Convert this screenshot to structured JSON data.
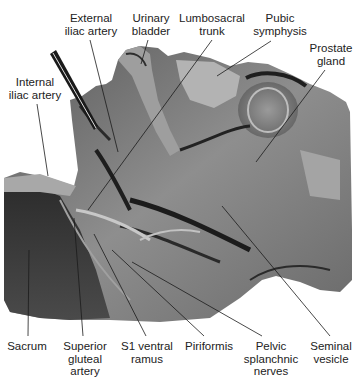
{
  "figure": {
    "type": "anatomical-photograph",
    "colors": {
      "background": "#ffffff",
      "label_text": "#222222",
      "leader_line": "#1a1a1a",
      "tissue_dark": "#2a2a2a",
      "tissue_mid": "#6e6e6e",
      "tissue_light": "#b5b5b5"
    },
    "labels": [
      {
        "id": "external-iliac-artery",
        "text": "External\niliac artery",
        "x": 66,
        "y": 12,
        "w": 50,
        "pointer": {
          "x1": 90,
          "y1": 40,
          "x2": 118,
          "y2": 152
        }
      },
      {
        "id": "urinary-bladder",
        "text": "Urinary\nbladder",
        "x": 128,
        "y": 12,
        "w": 46,
        "pointer": {
          "x1": 148,
          "y1": 40,
          "x2": 141,
          "y2": 64
        }
      },
      {
        "id": "lumbosacral-trunk",
        "text": "Lumbosacral\ntrunk",
        "x": 178,
        "y": 12,
        "w": 68,
        "pointer": {
          "x1": 212,
          "y1": 40,
          "x2": 88,
          "y2": 210
        }
      },
      {
        "id": "pubic-symphysis",
        "text": "Pubic\nsymphysis",
        "x": 250,
        "y": 12,
        "w": 60,
        "pointer": {
          "x1": 271,
          "y1": 41,
          "x2": 217,
          "y2": 76
        }
      },
      {
        "id": "prostate-gland",
        "text": "Prostate\ngland",
        "x": 307,
        "y": 42,
        "w": 50,
        "pointer": {
          "x1": 325,
          "y1": 70,
          "x2": 256,
          "y2": 162
        }
      },
      {
        "id": "internal-iliac-artery",
        "text": "Internal\niliac artery",
        "x": 4,
        "y": 76,
        "w": 58,
        "pointer": {
          "x1": 37,
          "y1": 104,
          "x2": 48,
          "y2": 176
        }
      },
      {
        "id": "sacrum",
        "text": "Sacrum",
        "x": 4,
        "y": 339,
        "w": 46,
        "pointer": {
          "x1": 28,
          "y1": 336,
          "x2": 29,
          "y2": 250
        }
      },
      {
        "id": "superior-gluteal-artery",
        "text": "Superior\ngluteal\nartery",
        "x": 62,
        "y": 339,
        "w": 48,
        "pointer": {
          "x1": 83,
          "y1": 336,
          "x2": 74,
          "y2": 218
        }
      },
      {
        "id": "s1-ventral-ramus",
        "text": "S1 ventral\nramus",
        "x": 118,
        "y": 339,
        "w": 58,
        "pointer": {
          "x1": 146,
          "y1": 336,
          "x2": 94,
          "y2": 234
        }
      },
      {
        "id": "piriformis",
        "text": "Piriformis",
        "x": 180,
        "y": 339,
        "w": 58,
        "pointer": {
          "x1": 204,
          "y1": 336,
          "x2": 112,
          "y2": 250
        }
      },
      {
        "id": "pelvic-splanchnic-nerves",
        "text": "Pelvic\nsplanchnic\nnerves",
        "x": 240,
        "y": 339,
        "w": 62,
        "pointer": {
          "x1": 262,
          "y1": 336,
          "x2": 132,
          "y2": 262
        }
      },
      {
        "id": "seminal-vesicle",
        "text": "Seminal\nvesicle",
        "x": 305,
        "y": 339,
        "w": 50,
        "pointer": {
          "x1": 330,
          "y1": 336,
          "x2": 222,
          "y2": 206
        }
      }
    ]
  }
}
